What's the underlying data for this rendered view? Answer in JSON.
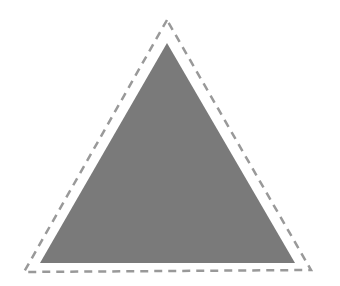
{
  "canvas": {
    "width": 340,
    "height": 286,
    "background": "#ffffff"
  },
  "shapes": {
    "outer_triangle": {
      "points": "167,20 24,272 311,270",
      "stroke": "#999999",
      "stroke_width": 2.5,
      "dash": "8,6",
      "fill": "none"
    },
    "inner_triangle": {
      "points": "167,43 40,263 295,263",
      "fill": "#7a7a7a"
    }
  }
}
